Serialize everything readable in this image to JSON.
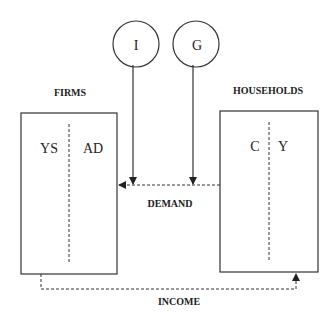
{
  "diagram": {
    "type": "circular-flow",
    "nodes": {
      "investment": {
        "label": "I"
      },
      "government": {
        "label": "G"
      },
      "firms": {
        "title": "FIRMS",
        "left_label": "YS",
        "right_label": "AD"
      },
      "households": {
        "title": "HOUSEHOLDS",
        "left_label": "C",
        "right_label": "Y"
      }
    },
    "flows": {
      "demand": {
        "label": "DEMAND",
        "from": "households",
        "to": "firms"
      },
      "income": {
        "label": "INCOME",
        "from": "firms",
        "to": "households"
      }
    },
    "colors": {
      "line": "#333333",
      "background": "#ffffff"
    }
  }
}
